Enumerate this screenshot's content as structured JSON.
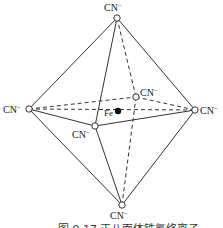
{
  "diagram": {
    "center_label": "Fe",
    "ligand_label": "CN",
    "ligand_charge": "−",
    "caption": "图 9.17   正八面体铁氰络离子"
  }
}
